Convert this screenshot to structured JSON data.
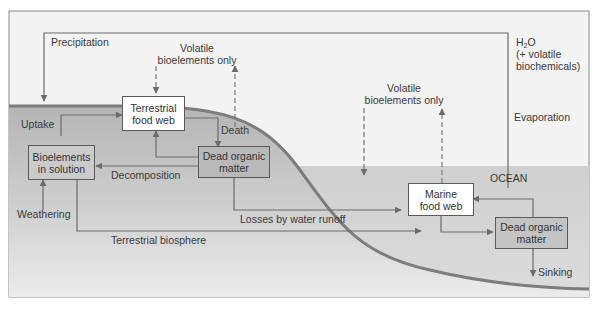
{
  "diagram": {
    "colors": {
      "land": "#b8b8b8",
      "ocean": "#d2d2d2",
      "land_edge": "#7d7d7d",
      "arrow": "#6b6b6b",
      "frame_bg": "#f2f2f2",
      "box_gray": "#c4c4c4"
    },
    "boxes": {
      "terrestrial_food_web": [
        "Terrestrial",
        "food web"
      ],
      "bioelements_in_solution": [
        "Bioelements",
        "in solution"
      ],
      "dead_organic_matter_land": [
        "Dead organic",
        "matter"
      ],
      "marine_food_web": [
        "Marine",
        "food web"
      ],
      "dead_organic_matter_ocean": [
        "Dead organic",
        "matter"
      ]
    },
    "labels": {
      "precipitation": "Precipitation",
      "volatile_land": [
        "Volatile",
        "bioelements only"
      ],
      "volatile_ocean": [
        "Volatile",
        "bioelements only"
      ],
      "h2o_prefix": "H",
      "h2o_sub": "2",
      "h2o_suffix": "O",
      "h2o_line2": "(+ volatile",
      "h2o_line3": "biochemicals)",
      "evaporation": "Evaporation",
      "uptake": "Uptake",
      "death": "Death",
      "decomposition": "Decomposition",
      "weathering": "Weathering",
      "losses_by_water_runoff": "Losses by water runoff",
      "terrestrial_biosphere": "Terrestrial biosphere",
      "ocean": "OCEAN",
      "sinking": "Sinking"
    },
    "nodes": [
      "Terrestrial food web",
      "Bioelements in solution",
      "Dead organic matter (land)",
      "Marine food web",
      "Dead organic matter (ocean)"
    ],
    "edges": [
      {
        "from": "Atmosphere",
        "to": "Land",
        "label": "Precipitation"
      },
      {
        "from": "Ocean",
        "to": "Atmosphere",
        "label": "Evaporation"
      },
      {
        "from": "Bioelements in solution",
        "to": "Terrestrial food web",
        "label": "Uptake"
      },
      {
        "from": "Terrestrial food web",
        "to": "Dead organic matter (land)",
        "label": "Death"
      },
      {
        "from": "Dead organic matter (land)",
        "to": "Terrestrial food web",
        "label": ""
      },
      {
        "from": "Dead organic matter (land)",
        "to": "Bioelements in solution",
        "label": "Decomposition"
      },
      {
        "from": "Weathering",
        "to": "Bioelements in solution",
        "label": "Weathering"
      },
      {
        "from": "Dead organic matter (land)",
        "to": "Marine food web",
        "label": "Losses by water runoff"
      },
      {
        "from": "Bioelements in solution",
        "to": "Ocean",
        "label": "Terrestrial biosphere"
      },
      {
        "from": "Marine food web",
        "to": "Dead organic matter (ocean)",
        "label": ""
      },
      {
        "from": "Dead organic matter (ocean)",
        "to": "Marine food web",
        "label": ""
      },
      {
        "from": "Dead organic matter (ocean)",
        "to": "Deep ocean",
        "label": "Sinking"
      },
      {
        "from": "Atmosphere",
        "to": "Terrestrial food web",
        "label": "Volatile bioelements only",
        "style": "dashed"
      },
      {
        "from": "Dead organic matter (land)",
        "to": "Atmosphere",
        "label": "Volatile bioelements only",
        "style": "dashed"
      },
      {
        "from": "Atmosphere",
        "to": "Ocean",
        "label": "Volatile bioelements only",
        "style": "dashed"
      },
      {
        "from": "Marine food web",
        "to": "Atmosphere",
        "label": "Volatile bioelements only",
        "style": "dashed"
      }
    ]
  }
}
